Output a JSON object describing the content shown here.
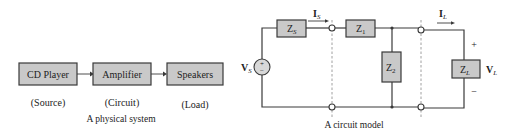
{
  "physical_system": {
    "blocks": [
      {
        "label": "CD Player",
        "role": "(Source)"
      },
      {
        "label": "Amplifier",
        "role": "(Circuit)"
      },
      {
        "label": "Speakers",
        "role": "(Load)"
      }
    ],
    "caption": "A physical system"
  },
  "circuit_model": {
    "source_label": "V",
    "source_sub": "S",
    "source_plus": "+",
    "source_minus": "−",
    "zs_label": "Z",
    "zs_sub": "S",
    "z1_label": "Z",
    "z1_sub": "1",
    "z2_label": "Z",
    "z2_sub": "2",
    "zl_label": "Z",
    "zl_sub": "L",
    "is_label": "I",
    "is_sub": "S",
    "il_label": "I",
    "il_sub": "L",
    "vl_label": "V",
    "vl_sub": "L",
    "vl_plus": "+",
    "vl_minus": "−",
    "caption": "A circuit model"
  }
}
